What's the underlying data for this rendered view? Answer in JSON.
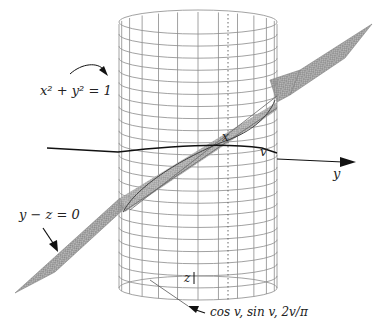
{
  "figure": {
    "labels": {
      "cylinder_eq": "x² + y² = 1",
      "plane_eq": "y − z = 0",
      "x_axis": "x",
      "v_point": "v",
      "y_axis": "y",
      "z_axis": "z",
      "helix_param": "cos v, sin v, 2v/π"
    },
    "colors": {
      "background": "#ffffff",
      "grid": "#8a8a8a",
      "plane_fill": "#9a9a9a",
      "axis": "#111111",
      "text": "#222222"
    },
    "cylinder": {
      "columns": 12,
      "rows": 22
    }
  }
}
